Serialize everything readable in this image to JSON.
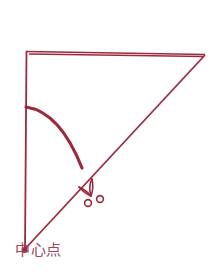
{
  "diagram": {
    "type": "paper-folding-cut-guide",
    "colors": {
      "line": "#9b2a3e",
      "label": "#a0465a",
      "background": "#ffffff"
    },
    "shapes": {
      "triangle": {
        "top_left": [
          26,
          52
        ],
        "top_right": [
          205,
          55
        ],
        "center_point": [
          24,
          250
        ]
      },
      "arc": {
        "start": [
          26,
          107
        ],
        "end": [
          82,
          168
        ],
        "description": "thick curved cut line"
      },
      "scissors_icon": "scissors-icon"
    },
    "labels": {
      "center_point": "中心点"
    }
  }
}
